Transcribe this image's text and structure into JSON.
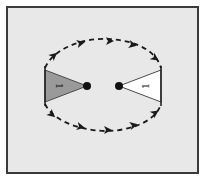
{
  "diagram": {
    "type": "braid-exchange",
    "background_color": "#e8e8e8",
    "frame_color": "#3a3a3a",
    "left_sector": {
      "label": "1",
      "fill": "#9a9a9a"
    },
    "right_sector": {
      "label": "1",
      "fill": "#ffffff"
    },
    "punctures": [
      {
        "name": "left-puncture"
      },
      {
        "name": "right-puncture"
      }
    ],
    "path": {
      "style": "dashed",
      "arrows_top": 4,
      "arrows_bottom": 4,
      "direction": "clockwise"
    }
  }
}
